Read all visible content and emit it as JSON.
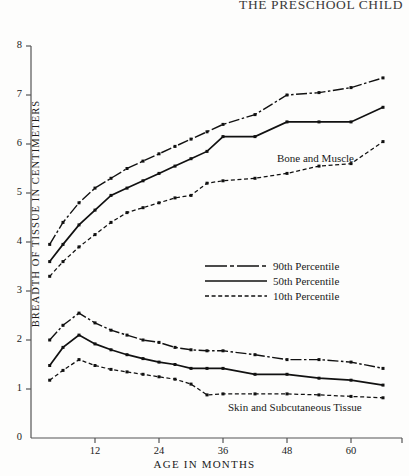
{
  "running_head": "THE PRESCHOOL CHILD",
  "figure": {
    "ylabel": "BREADTH OF TISSUE IN CENTIMETERS",
    "xlabel": "AGE  IN  MONTHS",
    "annotations": {
      "bone": "Bone and Muscle",
      "skin": "Skin and Subcutaneous Tissue"
    },
    "legend": {
      "p90": "90th Percentile",
      "p50": "50th Percentile",
      "p10": "10th Percentile"
    }
  },
  "chart_data": {
    "type": "line",
    "title": "",
    "xlabel": "AGE IN MONTHS",
    "ylabel": "BREADTH OF TISSUE IN CENTIMETERS",
    "xlim": [
      0,
      70
    ],
    "ylim": [
      0,
      8
    ],
    "xticks": [
      12,
      24,
      36,
      48,
      60
    ],
    "yticks": [
      0,
      1,
      2,
      3,
      4,
      5,
      6,
      7,
      8
    ],
    "grid": false,
    "legend_position": "center",
    "groups": [
      {
        "name": "Bone and Muscle",
        "series": [
          {
            "name": "90th Percentile",
            "style": "dash-dot",
            "x": [
              3.5,
              6,
              9,
              12,
              15,
              18,
              21,
              24,
              27,
              30,
              33,
              36,
              42,
              48,
              54,
              60,
              66
            ],
            "values": [
              3.95,
              4.4,
              4.8,
              5.1,
              5.3,
              5.5,
              5.65,
              5.8,
              5.95,
              6.1,
              6.25,
              6.4,
              6.6,
              7.0,
              7.05,
              7.15,
              7.35
            ]
          },
          {
            "name": "50th Percentile",
            "style": "solid",
            "x": [
              3.5,
              6,
              9,
              12,
              15,
              18,
              21,
              24,
              27,
              30,
              33,
              36,
              42,
              48,
              54,
              60,
              66
            ],
            "values": [
              3.6,
              3.95,
              4.35,
              4.65,
              4.95,
              5.1,
              5.25,
              5.4,
              5.55,
              5.7,
              5.85,
              6.15,
              6.15,
              6.45,
              6.45,
              6.45,
              6.75
            ]
          },
          {
            "name": "10th Percentile",
            "style": "dashed",
            "x": [
              3.5,
              6,
              9,
              12,
              15,
              18,
              21,
              24,
              27,
              30,
              33,
              36,
              42,
              48,
              54,
              60,
              66
            ],
            "values": [
              3.3,
              3.6,
              3.9,
              4.15,
              4.4,
              4.6,
              4.7,
              4.8,
              4.9,
              4.95,
              5.2,
              5.25,
              5.3,
              5.4,
              5.55,
              5.6,
              6.05
            ]
          }
        ]
      },
      {
        "name": "Skin and Subcutaneous Tissue",
        "series": [
          {
            "name": "90th Percentile",
            "style": "dash-dot",
            "x": [
              3.5,
              6,
              9,
              12,
              15,
              18,
              21,
              24,
              27,
              30,
              33,
              36,
              42,
              48,
              54,
              60,
              66
            ],
            "values": [
              2.0,
              2.3,
              2.55,
              2.35,
              2.2,
              2.1,
              2.0,
              1.95,
              1.85,
              1.8,
              1.78,
              1.78,
              1.7,
              1.6,
              1.6,
              1.55,
              1.42
            ]
          },
          {
            "name": "50th Percentile",
            "style": "solid",
            "x": [
              3.5,
              6,
              9,
              12,
              15,
              18,
              21,
              24,
              27,
              30,
              33,
              36,
              42,
              48,
              54,
              60,
              66
            ],
            "values": [
              1.48,
              1.85,
              2.1,
              1.92,
              1.8,
              1.7,
              1.62,
              1.55,
              1.5,
              1.42,
              1.42,
              1.42,
              1.3,
              1.3,
              1.22,
              1.18,
              1.08
            ]
          },
          {
            "name": "10th Percentile",
            "style": "dashed",
            "x": [
              3.5,
              6,
              9,
              12,
              15,
              18,
              21,
              24,
              27,
              30,
              33,
              36,
              42,
              48,
              54,
              60,
              66
            ],
            "values": [
              1.18,
              1.38,
              1.6,
              1.48,
              1.4,
              1.35,
              1.3,
              1.25,
              1.2,
              1.1,
              0.88,
              0.9,
              0.9,
              0.9,
              0.88,
              0.85,
              0.82
            ]
          }
        ]
      }
    ]
  }
}
